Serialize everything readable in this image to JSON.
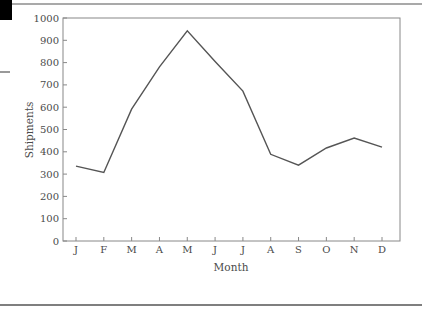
{
  "page": {
    "marker_color": "#000000",
    "rule_color": "#555555"
  },
  "chart_data": {
    "type": "line",
    "title": "",
    "xlabel": "Month",
    "ylabel": "Shipments",
    "categories": [
      "J",
      "F",
      "M",
      "A",
      "M",
      "J",
      "J",
      "A",
      "S",
      "O",
      "N",
      "D"
    ],
    "series": [
      {
        "name": "Shipments",
        "values": [
          336,
          307,
          591,
          781,
          942,
          805,
          672,
          389,
          340,
          417,
          462,
          421
        ],
        "color": "#555555"
      }
    ],
    "ylim": [
      0,
      1000
    ],
    "yticks": [
      0,
      100,
      200,
      300,
      400,
      500,
      600,
      700,
      800,
      900,
      1000
    ],
    "grid": false,
    "legend": null,
    "frame_color": "#888888"
  }
}
